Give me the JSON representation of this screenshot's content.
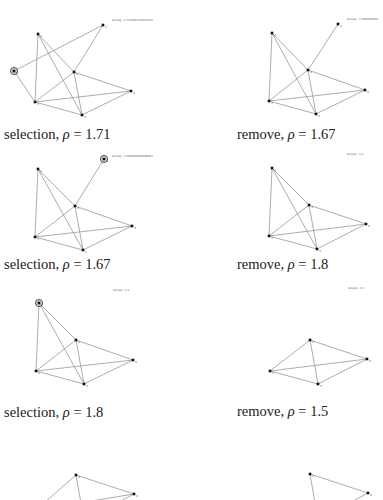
{
  "figure": {
    "panels": [
      {
        "id": "p1",
        "caption_op": "selection",
        "rho": "1.71",
        "density_label": "density : 1.7142857142857142",
        "selected_node": "0",
        "nodes": [
          {
            "id": "0",
            "x": 14,
            "y": 71,
            "label": "0"
          },
          {
            "id": "1",
            "x": 38,
            "y": 34,
            "label": "1"
          },
          {
            "id": "2",
            "x": 35,
            "y": 102,
            "label": "2"
          },
          {
            "id": "3",
            "x": 103,
            "y": 25,
            "label": "3"
          },
          {
            "id": "4",
            "x": 74,
            "y": 72,
            "label": "4"
          },
          {
            "id": "5",
            "x": 82,
            "y": 115,
            "label": "5"
          },
          {
            "id": "6",
            "x": 131,
            "y": 91,
            "label": "6"
          }
        ],
        "edges": [
          [
            "0",
            "3"
          ],
          [
            "0",
            "2"
          ],
          [
            "1",
            "2"
          ],
          [
            "1",
            "4"
          ],
          [
            "1",
            "5"
          ],
          [
            "2",
            "4"
          ],
          [
            "2",
            "6"
          ],
          [
            "2",
            "5"
          ],
          [
            "3",
            "4"
          ],
          [
            "4",
            "6"
          ],
          [
            "4",
            "5"
          ],
          [
            "5",
            "6"
          ]
        ]
      },
      {
        "id": "p2",
        "caption_op": "remove",
        "rho": "1.67",
        "density_label": "density : 1.6666666666",
        "selected_node": null,
        "nodes": [
          {
            "id": "1",
            "x": 80,
            "y": 33,
            "label": "1"
          },
          {
            "id": "2",
            "x": 77,
            "y": 101,
            "label": "2"
          },
          {
            "id": "3",
            "x": 146,
            "y": 24,
            "label": "3"
          },
          {
            "id": "4",
            "x": 116,
            "y": 70,
            "label": "4"
          },
          {
            "id": "5",
            "x": 124,
            "y": 114,
            "label": "5"
          },
          {
            "id": "6",
            "x": 173,
            "y": 90,
            "label": "6"
          }
        ],
        "edges": [
          [
            "1",
            "2"
          ],
          [
            "1",
            "4"
          ],
          [
            "1",
            "5"
          ],
          [
            "2",
            "4"
          ],
          [
            "2",
            "6"
          ],
          [
            "2",
            "5"
          ],
          [
            "3",
            "4"
          ],
          [
            "4",
            "6"
          ],
          [
            "4",
            "5"
          ],
          [
            "5",
            "6"
          ]
        ]
      },
      {
        "id": "p3",
        "caption_op": "selection",
        "rho": "1.67",
        "density_label": "density : 1.6666666666666667",
        "selected_node": "3",
        "nodes": [
          {
            "id": "1",
            "x": 38,
            "y": 49,
            "label": "1"
          },
          {
            "id": "2",
            "x": 35,
            "y": 117,
            "label": "2"
          },
          {
            "id": "3",
            "x": 104,
            "y": 39,
            "label": "3"
          },
          {
            "id": "4",
            "x": 75,
            "y": 86,
            "label": "4"
          },
          {
            "id": "5",
            "x": 83,
            "y": 130,
            "label": "5"
          },
          {
            "id": "6",
            "x": 132,
            "y": 106,
            "label": "6"
          }
        ],
        "edges": [
          [
            "1",
            "2"
          ],
          [
            "1",
            "4"
          ],
          [
            "1",
            "5"
          ],
          [
            "2",
            "4"
          ],
          [
            "2",
            "6"
          ],
          [
            "2",
            "5"
          ],
          [
            "3",
            "4"
          ],
          [
            "4",
            "6"
          ],
          [
            "4",
            "5"
          ],
          [
            "5",
            "6"
          ]
        ]
      },
      {
        "id": "p4",
        "caption_op": "remove",
        "rho": "1.8",
        "density_label": "density : 1.8",
        "selected_node": null,
        "nodes": [
          {
            "id": "1",
            "x": 80,
            "y": 48,
            "label": "1"
          },
          {
            "id": "2",
            "x": 77,
            "y": 116,
            "label": "2"
          },
          {
            "id": "4",
            "x": 117,
            "y": 85,
            "label": "4"
          },
          {
            "id": "5",
            "x": 125,
            "y": 129,
            "label": "5"
          },
          {
            "id": "6",
            "x": 174,
            "y": 104,
            "label": "6"
          }
        ],
        "edges": [
          [
            "1",
            "2"
          ],
          [
            "1",
            "4"
          ],
          [
            "1",
            "5"
          ],
          [
            "2",
            "4"
          ],
          [
            "2",
            "6"
          ],
          [
            "2",
            "5"
          ],
          [
            "4",
            "6"
          ],
          [
            "4",
            "5"
          ],
          [
            "5",
            "6"
          ]
        ]
      },
      {
        "id": "p5",
        "caption_op": "selection",
        "rho": "1.8",
        "density_label": "density : 1.8",
        "selected_node": "1",
        "nodes": [
          {
            "id": "1",
            "x": 39,
            "y": 53,
            "label": "1"
          },
          {
            "id": "2",
            "x": 36,
            "y": 121,
            "label": "2"
          },
          {
            "id": "4",
            "x": 76,
            "y": 90,
            "label": "4"
          },
          {
            "id": "5",
            "x": 84,
            "y": 134,
            "label": "5"
          },
          {
            "id": "6",
            "x": 133,
            "y": 110,
            "label": "6"
          }
        ],
        "edges": [
          [
            "1",
            "2"
          ],
          [
            "1",
            "4"
          ],
          [
            "1",
            "5"
          ],
          [
            "2",
            "4"
          ],
          [
            "2",
            "6"
          ],
          [
            "2",
            "5"
          ],
          [
            "4",
            "6"
          ],
          [
            "4",
            "5"
          ],
          [
            "5",
            "6"
          ]
        ]
      },
      {
        "id": "p6",
        "caption_op": "remove",
        "rho": "1.5",
        "density_label": "density : 1.5",
        "selected_node": null,
        "nodes": [
          {
            "id": "2",
            "x": 78,
            "y": 121,
            "label": "2"
          },
          {
            "id": "4",
            "x": 118,
            "y": 90,
            "label": "4"
          },
          {
            "id": "5",
            "x": 126,
            "y": 134,
            "label": "5"
          },
          {
            "id": "6",
            "x": 175,
            "y": 109,
            "label": "6"
          }
        ],
        "edges": [
          [
            "2",
            "4"
          ],
          [
            "2",
            "6"
          ],
          [
            "2",
            "5"
          ],
          [
            "4",
            "6"
          ],
          [
            "4",
            "5"
          ],
          [
            "5",
            "6"
          ]
        ]
      },
      {
        "id": "p7",
        "caption_op": "",
        "rho": "",
        "density_label": "",
        "selected_node": null,
        "nodes": [
          {
            "id": "2",
            "x": 36,
            "y": 140,
            "label": "2"
          },
          {
            "id": "4",
            "x": 76,
            "y": 105,
            "label": "4"
          },
          {
            "id": "5",
            "x": 84,
            "y": 150,
            "label": "5"
          },
          {
            "id": "6",
            "x": 134,
            "y": 124,
            "label": "6"
          }
        ],
        "edges": [
          [
            "2",
            "4"
          ],
          [
            "2",
            "6"
          ],
          [
            "4",
            "6"
          ],
          [
            "4",
            "5"
          ],
          [
            "5",
            "6"
          ]
        ]
      },
      {
        "id": "p8",
        "caption_op": "",
        "rho": "",
        "density_label": "",
        "selected_node": null,
        "nodes": [
          {
            "id": "4",
            "x": 118,
            "y": 104,
            "label": "4"
          },
          {
            "id": "5",
            "x": 126,
            "y": 150,
            "label": "5"
          },
          {
            "id": "6",
            "x": 176,
            "y": 123,
            "label": "6"
          }
        ],
        "edges": [
          [
            "4",
            "6"
          ],
          [
            "4",
            "5"
          ],
          [
            "5",
            "6"
          ]
        ]
      }
    ],
    "captions": [
      {
        "op": "selection",
        "rho_symbol": "ρ",
        "eq": " = ",
        "value": "1.71"
      },
      {
        "op": "remove",
        "rho_symbol": "ρ",
        "eq": " = ",
        "value": "1.67"
      },
      {
        "op": "selection",
        "rho_symbol": "ρ",
        "eq": " = ",
        "value": "1.67"
      },
      {
        "op": "remove",
        "rho_symbol": "ρ",
        "eq": " = ",
        "value": "1.8"
      },
      {
        "op": "selection",
        "rho_symbol": "ρ",
        "eq": " = ",
        "value": "1.8"
      },
      {
        "op": "remove",
        "rho_symbol": "ρ",
        "eq": " = ",
        "value": "1.5"
      }
    ],
    "density_labels": [
      "density : 1.7142857142857142",
      "density : 1.6666666666",
      "density : 1.6666666666666667",
      "density : 1.8",
      "density : 1.8",
      "density : 1.5"
    ],
    "colors": {
      "edge": "#8a8a8a",
      "node": "#111111",
      "selected_ring": "#333333",
      "caption_text": "#222222"
    }
  }
}
